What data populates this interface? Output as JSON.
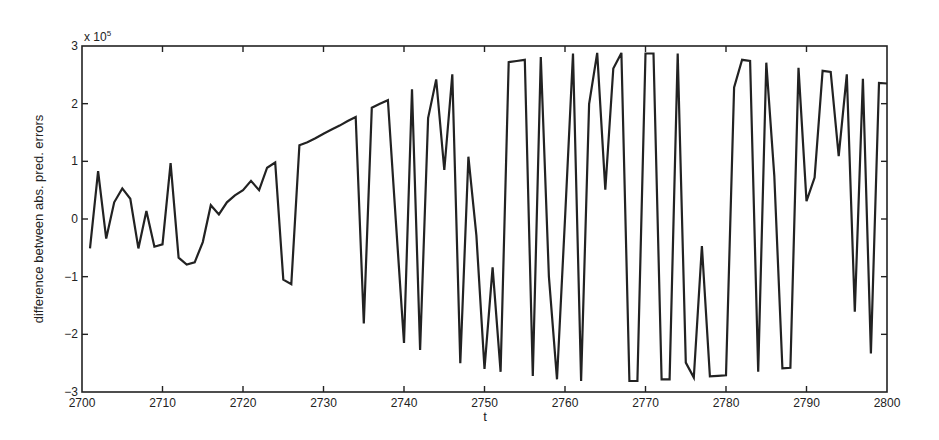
{
  "chart_data": {
    "type": "line",
    "title": "",
    "xlabel": "t",
    "ylabel": "difference between abs. pred. errors",
    "y_scale_label": "x 10",
    "y_scale_exponent": "5",
    "xlim": [
      2700,
      2800
    ],
    "ylim": [
      -3,
      3
    ],
    "grid": false,
    "legend": null,
    "x_ticks": [
      2700,
      2710,
      2720,
      2730,
      2740,
      2750,
      2760,
      2770,
      2780,
      2790,
      2800
    ],
    "y_ticks": [
      -3,
      -2,
      -1,
      0,
      1,
      2,
      3
    ],
    "line_color": "#222222",
    "series": [
      {
        "name": "difference",
        "x": [
          2701,
          2702,
          2703,
          2704,
          2705,
          2706,
          2707,
          2708,
          2709,
          2710,
          2711,
          2712,
          2713,
          2714,
          2715,
          2716,
          2717,
          2718,
          2719,
          2720,
          2721,
          2722,
          2723,
          2724,
          2725,
          2726,
          2727,
          2728,
          2729,
          2730,
          2731,
          2732,
          2733,
          2734,
          2735,
          2736,
          2737,
          2738,
          2739,
          2740,
          2741,
          2742,
          2743,
          2744,
          2745,
          2746,
          2747,
          2748,
          2749,
          2750,
          2751,
          2752,
          2753,
          2754,
          2755,
          2756,
          2757,
          2758,
          2759,
          2760,
          2761,
          2762,
          2763,
          2764,
          2765,
          2766,
          2767,
          2768,
          2769,
          2770,
          2771,
          2772,
          2773,
          2774,
          2775,
          2776,
          2777,
          2778,
          2779,
          2780,
          2781,
          2782,
          2783,
          2784,
          2785,
          2786,
          2787,
          2788,
          2789,
          2790,
          2791,
          2792,
          2793,
          2794,
          2795,
          2796,
          2797,
          2798,
          2799,
          2800
        ],
        "values": [
          -0.51,
          0.83,
          -0.34,
          0.29,
          0.53,
          0.35,
          -0.51,
          0.14,
          -0.48,
          -0.44,
          0.97,
          -0.67,
          -0.79,
          -0.75,
          -0.4,
          0.24,
          0.08,
          0.29,
          0.41,
          0.5,
          0.66,
          0.5,
          0.89,
          0.98,
          -1.05,
          -1.13,
          1.28,
          1.33,
          1.4,
          1.48,
          1.55,
          1.62,
          1.7,
          1.77,
          -1.81,
          1.93,
          2.0,
          2.06,
          -0.05,
          -2.15,
          2.25,
          -2.27,
          1.75,
          2.42,
          0.85,
          2.51,
          -2.5,
          1.08,
          -0.29,
          -2.6,
          -0.84,
          -2.65,
          2.72,
          2.74,
          2.76,
          -2.72,
          2.81,
          -1.0,
          -2.78,
          0.0,
          2.87,
          -2.81,
          1.99,
          2.88,
          0.51,
          2.61,
          2.88,
          -2.81,
          -2.81,
          2.87,
          2.87,
          -2.78,
          -2.78,
          2.87,
          -2.49,
          -2.75,
          -0.47,
          -2.73,
          -2.72,
          -2.71,
          2.28,
          2.76,
          2.74,
          -2.65,
          2.71,
          0.75,
          -2.59,
          -2.58,
          2.62,
          0.31,
          0.72,
          2.57,
          2.55,
          1.09,
          2.51,
          -1.61,
          2.43,
          -2.33,
          2.36,
          2.35
        ]
      }
    ]
  }
}
